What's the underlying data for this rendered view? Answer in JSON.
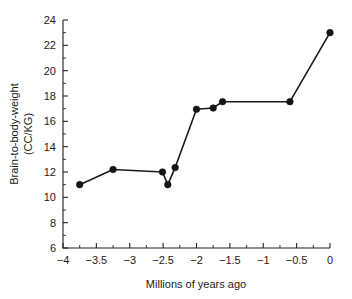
{
  "chart_data": {
    "type": "line",
    "title": "",
    "subtitle": "",
    "xlabel": "Millions of years ago",
    "ylabel": "Brain-to-body-weight (CC/KG)",
    "ylabel_line1": "Brain-to-body-weight",
    "ylabel_line2": "(CC/KG)",
    "xlim": [
      -4,
      0
    ],
    "ylim": [
      6,
      24
    ],
    "grid": false,
    "legend": null,
    "legend_position": "none",
    "marker": "filled-circle",
    "x_major_ticks": [
      -4,
      -3.5,
      -3,
      -2.5,
      -2,
      -1.5,
      -1,
      -0.5,
      0
    ],
    "x_tick_labels": [
      "−4",
      "−3.5",
      "−3",
      "−2.5",
      "−2",
      "−1.5",
      "−1",
      "−0.5",
      "0"
    ],
    "x_minor_tick_interval": 0.25,
    "y_major_ticks": [
      6,
      8,
      10,
      12,
      14,
      16,
      18,
      20,
      22,
      24
    ],
    "y_tick_labels": [
      "6",
      "8",
      "10",
      "12",
      "14",
      "16",
      "18",
      "20",
      "22",
      "24"
    ],
    "x": [
      -3.75,
      -3.25,
      -2.51,
      -2.43,
      -2.32,
      -2.0,
      -1.75,
      -1.61,
      -0.6,
      0.0
    ],
    "values": [
      11.0,
      12.2,
      12.0,
      11.0,
      12.35,
      16.95,
      17.05,
      17.55,
      17.55,
      23.0
    ],
    "points": [
      {
        "x": -3.75,
        "y": 11.0
      },
      {
        "x": -3.25,
        "y": 12.2
      },
      {
        "x": -2.51,
        "y": 12.0
      },
      {
        "x": -2.43,
        "y": 11.0
      },
      {
        "x": -2.32,
        "y": 12.35
      },
      {
        "x": -2.0,
        "y": 16.95
      },
      {
        "x": -1.75,
        "y": 17.05
      },
      {
        "x": -1.61,
        "y": 17.55
      },
      {
        "x": -0.6,
        "y": 17.55
      },
      {
        "x": 0.0,
        "y": 23.0
      }
    ],
    "series": [
      {
        "name": "Brain-to-body-weight",
        "color": "#1b1b1b",
        "values": [
          11.0,
          12.2,
          12.0,
          11.0,
          12.35,
          16.95,
          17.05,
          17.55,
          17.55,
          23.0
        ]
      }
    ]
  }
}
